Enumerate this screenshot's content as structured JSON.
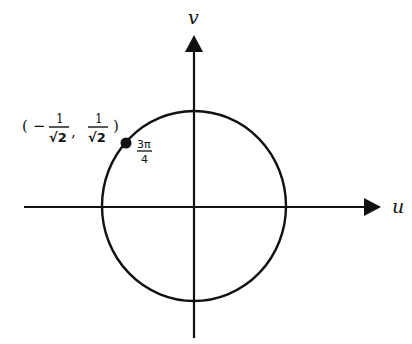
{
  "diagram": {
    "type": "unit-circle",
    "axes": {
      "horizontal_label": "u",
      "vertical_label": "v"
    },
    "circle": {
      "center": [
        194,
        206
      ],
      "radius": 94
    },
    "point": {
      "angle_label_num": "3π",
      "angle_label_den": "4",
      "coordinates": {
        "open_paren": "(",
        "minus": "−",
        "x_num": "1",
        "x_den": "√2",
        "comma": ",",
        "y_num": "1",
        "y_den": "√2",
        "close_paren": ")"
      }
    },
    "colors": {
      "stroke": "#111111",
      "background": "#ffffff"
    }
  }
}
